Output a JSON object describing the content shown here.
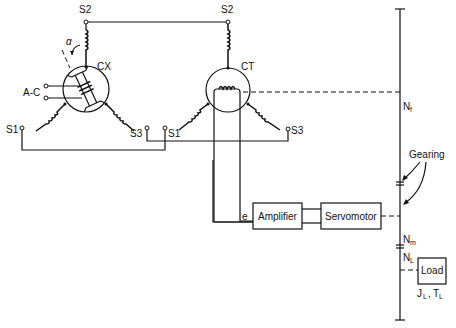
{
  "cx": {
    "label": "CX",
    "input_label": "A-C",
    "angle_label": "α",
    "terminals": {
      "s1": "S1",
      "s2": "S2",
      "s3": "S3"
    }
  },
  "ct": {
    "label": "CT",
    "terminals": {
      "s1": "S1",
      "s2": "S2",
      "s3": "S3"
    }
  },
  "error_signal": "e",
  "amplifier": {
    "label": "Amplifier"
  },
  "servomotor": {
    "label": "Servomotor"
  },
  "load": {
    "label": "Load",
    "params": "JL, TL",
    "j": "J",
    "j_sub": "L",
    "t": "T",
    "t_sub": "L"
  },
  "gearing": {
    "label": "Gearing"
  },
  "shaft": {
    "nf": "N",
    "nf_sub": "f",
    "nm": "N",
    "nm_sub": "m",
    "nl": "N",
    "nl_sub": "L"
  }
}
